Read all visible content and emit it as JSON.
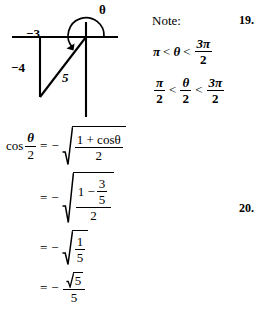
{
  "diagram": {
    "name": "angle-in-standard-position-diagram",
    "labels": {
      "x_leg": "−3",
      "y_leg": "−4",
      "hypotenuse": "5",
      "angle": "θ"
    },
    "terminal_point": {
      "x": -3,
      "y": -4
    },
    "radius": 5,
    "arc_direction": "counterclockwise",
    "arc_start_deg": 0,
    "arc_end_deg": 233
  },
  "note": {
    "title": "Note:",
    "inequality_1": {
      "left": "π",
      "rel_1": "<",
      "middle": "θ",
      "rel_2": "<",
      "right_num": "3π",
      "right_den": "2"
    },
    "inequality_2": {
      "left_num": "π",
      "left_den": "2",
      "rel_1": "<",
      "middle_num": "θ",
      "middle_den": "2",
      "rel_2": "<",
      "right_num": "3π",
      "right_den": "2"
    }
  },
  "derivation": {
    "line1": {
      "lhs_fn": "cos",
      "lhs_num": "θ",
      "lhs_den": "2",
      "eq": "=",
      "sign": "−",
      "radicand_num": "1 + cosθ",
      "radicand_den": "2"
    },
    "line2": {
      "eq": "=",
      "sign": "−",
      "radicand_outer_num_prefix": "1 −",
      "radicand_inner_num": "3",
      "radicand_inner_den": "5",
      "radicand_outer_den": "2"
    },
    "line3": {
      "eq": "=",
      "sign": "−",
      "radicand_num": "1",
      "radicand_den": "5"
    },
    "line4": {
      "eq": "=",
      "sign": "−",
      "num_radical": "5",
      "den": "5"
    }
  },
  "problem_numbers": {
    "upper": "19.",
    "lower": "20."
  },
  "colors": {
    "ink": "#000000",
    "page": "#ffffff"
  }
}
